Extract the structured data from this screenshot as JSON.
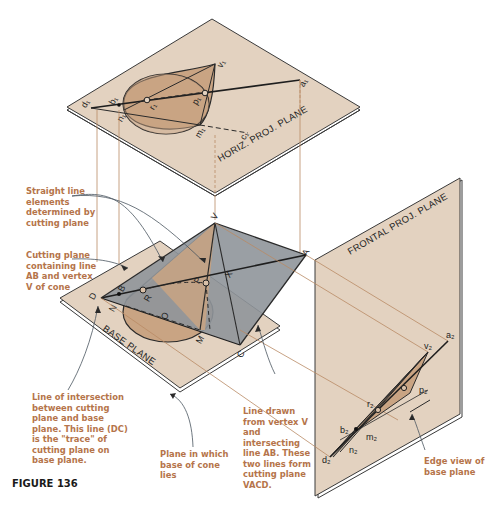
{
  "figure": {
    "caption": "FIGURE 136",
    "colors": {
      "plane_fill": "#e3d2c0",
      "cone_fill": "#c9a483",
      "cutting_plane_fill": "#8f959a",
      "callout_text": "#b5744a",
      "projector": "#b98a65"
    }
  },
  "planes": {
    "horizontal": "HORIZ. PROJ. PLANE",
    "base": "BASE PLANE",
    "frontal": "FRONTAL PROJ. PLANE"
  },
  "points": {
    "horizontal_view": [
      "d1",
      "b1",
      "n1",
      "r1",
      "p1",
      "v1",
      "m1",
      "c1",
      "a1"
    ],
    "pictorial": [
      "V",
      "A",
      "P",
      "X",
      "B",
      "R",
      "D",
      "N",
      "O",
      "M",
      "C"
    ],
    "frontal_view": [
      "a2",
      "v2",
      "p2",
      "r2",
      "b2",
      "m2",
      "n2",
      "d2"
    ]
  },
  "callouts": {
    "straight_lines": "Straight line elements determined by cutting plane",
    "cutting_plane": "Cutting plane containing line AB and vertex V of cone",
    "intersection": "Line of intersection between cutting plane and base plane. This line (DC) is the \"trace\" of cutting plane on base plane.",
    "base_plane": "Plane in which base of cone lies",
    "line_from_vertex": "Line drawn from vertex V and intersecting line AB. These two lines form cutting plane VACD.",
    "edge_view": "Edge view of base plane"
  }
}
